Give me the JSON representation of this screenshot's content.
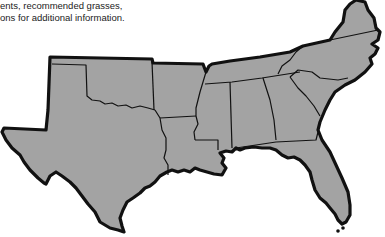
{
  "caption": {
    "lines": [
      "ents, recommended grasses,",
      "ons for additional information."
    ]
  },
  "map": {
    "title": "Southeastern United States region map",
    "fill_color": "#a3a3a3",
    "outline_color": "#111111",
    "states": [
      "Texas",
      "Oklahoma",
      "Arkansas",
      "Louisiana",
      "Mississippi",
      "Alabama",
      "Georgia",
      "Florida",
      "Tennessee",
      "South Carolina",
      "North Carolina",
      "Virginia"
    ]
  }
}
